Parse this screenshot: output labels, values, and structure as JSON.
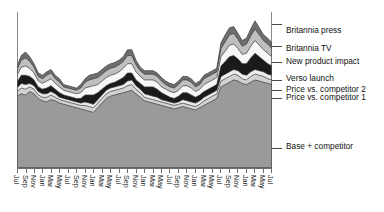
{
  "chart_data": {
    "type": "area",
    "title": "",
    "xlabel": "",
    "ylabel": "",
    "stacked": true,
    "grid": false,
    "legend_position": "right-callout",
    "axis_start": "Jul",
    "axis_end": "Jul",
    "categories": [
      "Jul",
      "Aug",
      "Sep",
      "Oct",
      "Nov",
      "Dec",
      "Jan",
      "Feb",
      "Mar",
      "Apr",
      "May",
      "Jun",
      "Jul",
      "Aug",
      "Sep",
      "Oct",
      "Nov",
      "Dec",
      "Jan",
      "Feb",
      "Mar",
      "Apr",
      "May",
      "Jun",
      "Jul",
      "Aug",
      "Sep",
      "Oct",
      "Nov",
      "Dec",
      "Jan",
      "Feb",
      "Mar",
      "Apr",
      "May",
      "Jun",
      "Jul",
      "Aug",
      "Sep",
      "Oct",
      "Nov",
      "Dec",
      "Jan",
      "Feb",
      "Mar",
      "Apr",
      "May",
      "Jun",
      "Jul",
      "Aug",
      "Sep",
      "Oct",
      "Nov",
      "Dec",
      "Jan",
      "Feb",
      "Mar",
      "Apr",
      "May",
      "Jun",
      "Jul"
    ],
    "tick_labels": [
      "Jul",
      "Sep",
      "Nov",
      "Jan",
      "Mar",
      "May",
      "Jul",
      "Sep",
      "Nov",
      "Jan",
      "Mar",
      "May",
      "Jul",
      "Sep",
      "Nov",
      "Jan",
      "Mar",
      "May",
      "Jul",
      "Sep",
      "Nov",
      "Jan",
      "Mar",
      "May",
      "Jul",
      "Sep",
      "Nov",
      "Jan",
      "Mar",
      "May",
      "Jul"
    ],
    "series": [
      {
        "name": "Base + competitor",
        "color": "#9a9a9a",
        "values": [
          62,
          64,
          63,
          66,
          64,
          60,
          58,
          57,
          59,
          58,
          56,
          55,
          54,
          53,
          52,
          51,
          50,
          49,
          48,
          52,
          56,
          60,
          62,
          63,
          64,
          65,
          66,
          67,
          64,
          61,
          58,
          57,
          56,
          55,
          54,
          53,
          52,
          51,
          52,
          53,
          52,
          51,
          50,
          52,
          54,
          56,
          58,
          60,
          70,
          72,
          74,
          76,
          75,
          73,
          72,
          74,
          76,
          75,
          74,
          73,
          72
        ]
      },
      {
        "name": "Price vs. competitor 1",
        "color": "#d2d2d2",
        "values": [
          4,
          5,
          5,
          4,
          4,
          3,
          3,
          4,
          4,
          3,
          3,
          3,
          3,
          3,
          3,
          3,
          4,
          4,
          4,
          4,
          4,
          4,
          4,
          4,
          4,
          4,
          5,
          5,
          4,
          4,
          3,
          3,
          3,
          3,
          3,
          3,
          3,
          3,
          3,
          3,
          3,
          3,
          3,
          3,
          4,
          4,
          4,
          4,
          5,
          5,
          5,
          5,
          5,
          4,
          4,
          5,
          5,
          5,
          5,
          4,
          4
        ]
      },
      {
        "name": "Price vs. competitor 2",
        "color": "#ededed",
        "values": [
          3,
          4,
          4,
          3,
          3,
          3,
          3,
          3,
          3,
          3,
          2,
          2,
          2,
          2,
          2,
          2,
          3,
          3,
          3,
          3,
          3,
          3,
          3,
          3,
          3,
          3,
          4,
          4,
          3,
          3,
          3,
          3,
          3,
          3,
          2,
          2,
          2,
          2,
          2,
          3,
          3,
          3,
          3,
          3,
          3,
          3,
          3,
          3,
          4,
          4,
          4,
          4,
          4,
          4,
          4,
          4,
          4,
          4,
          4,
          4,
          4
        ]
      },
      {
        "name": "Verso launch",
        "color": "#1a1a1a",
        "values": [
          5,
          7,
          8,
          6,
          5,
          4,
          4,
          5,
          5,
          4,
          4,
          3,
          3,
          3,
          3,
          4,
          6,
          7,
          8,
          6,
          5,
          4,
          4,
          4,
          5,
          6,
          7,
          6,
          5,
          5,
          6,
          7,
          8,
          7,
          6,
          5,
          4,
          4,
          5,
          6,
          7,
          6,
          5,
          5,
          5,
          5,
          5,
          5,
          9,
          11,
          13,
          12,
          10,
          9,
          10,
          12,
          14,
          12,
          10,
          9,
          8
        ]
      },
      {
        "name": "New product impact",
        "color": "#f7f7f7",
        "values": [
          6,
          7,
          8,
          7,
          6,
          5,
          5,
          6,
          6,
          5,
          5,
          4,
          4,
          4,
          4,
          5,
          6,
          7,
          8,
          7,
          7,
          7,
          7,
          7,
          7,
          8,
          8,
          8,
          7,
          6,
          6,
          6,
          6,
          6,
          5,
          5,
          5,
          5,
          5,
          6,
          6,
          6,
          5,
          5,
          6,
          6,
          6,
          6,
          8,
          9,
          10,
          10,
          9,
          8,
          9,
          10,
          11,
          10,
          9,
          9,
          8
        ]
      },
      {
        "name": "Britannia TV",
        "color": "#bfbfbf",
        "values": [
          5,
          6,
          7,
          6,
          5,
          4,
          4,
          5,
          5,
          4,
          4,
          3,
          3,
          3,
          3,
          4,
          5,
          6,
          6,
          6,
          6,
          6,
          6,
          6,
          6,
          6,
          7,
          7,
          6,
          5,
          5,
          5,
          5,
          5,
          5,
          4,
          4,
          4,
          5,
          5,
          5,
          5,
          4,
          4,
          5,
          5,
          5,
          5,
          7,
          8,
          9,
          9,
          8,
          7,
          8,
          9,
          10,
          9,
          8,
          8,
          7
        ]
      },
      {
        "name": "Britannia press",
        "color": "#6e6e6e",
        "values": [
          3,
          4,
          5,
          4,
          3,
          3,
          3,
          3,
          3,
          3,
          3,
          2,
          2,
          2,
          2,
          3,
          3,
          4,
          4,
          4,
          4,
          4,
          4,
          4,
          4,
          4,
          5,
          5,
          4,
          3,
          3,
          3,
          3,
          3,
          3,
          3,
          3,
          3,
          3,
          3,
          3,
          3,
          3,
          3,
          3,
          3,
          3,
          3,
          5,
          6,
          6,
          6,
          5,
          5,
          5,
          6,
          7,
          6,
          5,
          5,
          5
        ]
      }
    ]
  },
  "legend": {
    "items": [
      {
        "label": "Britannia press",
        "y": 32,
        "anchor_y": 24
      },
      {
        "label": "Britannia TV",
        "y": 50,
        "anchor_y": 46
      },
      {
        "label": "New product impact",
        "y": 63,
        "anchor_y": 62
      },
      {
        "label": "Verso launch",
        "y": 80,
        "anchor_y": 80
      },
      {
        "label": "Price vs. competitor 2",
        "y": 91,
        "anchor_y": 90
      },
      {
        "label": "Price vs. competitor 1",
        "y": 99,
        "anchor_y": 98
      },
      {
        "label": "Base + competitor",
        "y": 148,
        "anchor_y": 148
      }
    ]
  }
}
